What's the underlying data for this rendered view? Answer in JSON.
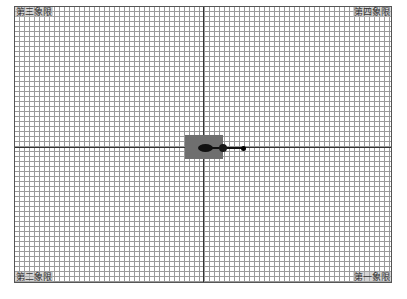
{
  "canvas": {
    "grid_spacing_px": 5,
    "grid_color": "#9a9a9a",
    "axis_color": "#333333"
  },
  "quadrants": {
    "top_left": "第三象限",
    "top_right": "第四象限",
    "bottom_left": "第二象限",
    "bottom_right": "第一象限"
  },
  "robot": {
    "base_color": "#6f6f6f",
    "arm_color": "#111111"
  }
}
